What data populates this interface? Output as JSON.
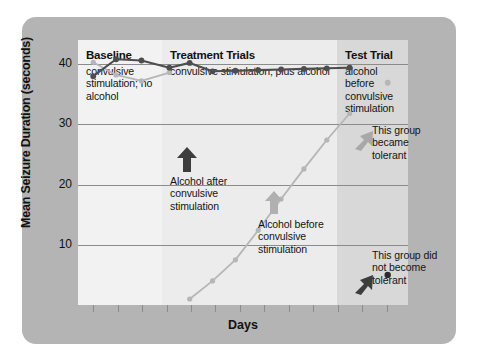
{
  "chart_data": {
    "type": "line",
    "title": "",
    "xlabel": "Days",
    "ylabel": "Mean Seizure Duration (seconds)",
    "ylim": [
      0,
      44
    ],
    "yticks": [
      10,
      20,
      30,
      40
    ],
    "grid": true,
    "legend": "none",
    "x_tick_count": 13,
    "panels": [
      {
        "id": "baseline",
        "title": "Baseline",
        "subtitle": "convulsive stimulation; no alcohol",
        "color": "#f2f2f2"
      },
      {
        "id": "treatment",
        "title": "Treatment Trials",
        "subtitle": "convulsive stimulation; plus alcohol",
        "color": "#ececec"
      },
      {
        "id": "test",
        "title": "Test Trial",
        "subtitle": "alcohol before convulsive stimulation",
        "color": "#d8d8d8"
      }
    ],
    "series": [
      {
        "name": "Alcohol after convulsive stimulation",
        "color": "#4d4d4d",
        "marker": "circle",
        "points": [
          {
            "x": 0.6,
            "y": 38.0
          },
          {
            "x": 1.5,
            "y": 40.8
          },
          {
            "x": 2.5,
            "y": 40.6
          },
          {
            "x": 3.6,
            "y": 39.4
          },
          {
            "x": 4.4,
            "y": 40.2
          },
          {
            "x": 5.3,
            "y": 38.8
          },
          {
            "x": 6.2,
            "y": 38.9
          },
          {
            "x": 7.1,
            "y": 39.0
          },
          {
            "x": 8.0,
            "y": 39.1
          },
          {
            "x": 8.9,
            "y": 39.2
          },
          {
            "x": 9.8,
            "y": 39.3
          },
          {
            "x": 10.7,
            "y": 39.4
          }
        ],
        "test_point": {
          "x": 12.2,
          "y": 5.0
        },
        "test_color": "#2b2b2b"
      },
      {
        "name": "Alcohol before convulsive stimulation",
        "color": "#b6b6b6",
        "marker": "circle",
        "points": [
          {
            "x": 0.6,
            "y": 40.3
          },
          {
            "x": 1.5,
            "y": 38.2
          },
          {
            "x": 2.5,
            "y": 37.2
          },
          {
            "x": 3.6,
            "y": 38.6
          }
        ],
        "rising_points": [
          {
            "x": 4.4,
            "y": 1.0
          },
          {
            "x": 5.3,
            "y": 4.0
          },
          {
            "x": 6.2,
            "y": 7.5
          },
          {
            "x": 7.1,
            "y": 12.4
          },
          {
            "x": 8.0,
            "y": 17.6
          },
          {
            "x": 8.9,
            "y": 22.6
          },
          {
            "x": 9.8,
            "y": 27.4
          },
          {
            "x": 10.7,
            "y": 31.8
          }
        ],
        "test_point": {
          "x": 12.2,
          "y": 36.9
        },
        "test_color": "#b6b6b6"
      }
    ],
    "annotations": [
      {
        "id": "alcohol-after",
        "text": "Alcohol after convulsive stimulation",
        "arrow": "up",
        "arrow_color": "#3d3d3d"
      },
      {
        "id": "alcohol-before",
        "text": "Alcohol before convulsive stimulation",
        "arrow": "up",
        "arrow_color": "#b0b0b0"
      },
      {
        "id": "became-tolerant",
        "text": "This group became tolerant",
        "arrow": "down-left",
        "arrow_color": "#a8a8a8"
      },
      {
        "id": "did-not-become-tolerant",
        "text": "This group did not become tolerant",
        "arrow": "down-left",
        "arrow_color": "#3d3d3d"
      }
    ]
  },
  "colors": {
    "card": "#b4b4b4",
    "background": "#ffffff",
    "gridline": "#8b8b8b",
    "text": "#111111"
  }
}
